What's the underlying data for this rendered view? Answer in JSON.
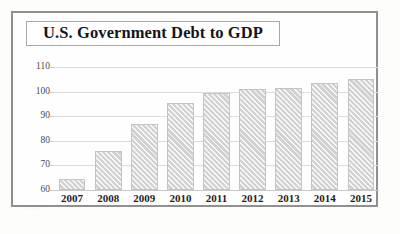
{
  "document": {
    "kind": "scanned-chart-figure"
  },
  "title": {
    "text": "U.S. Government Debt to GDP"
  },
  "axis": {
    "y_ticks": [
      "110",
      "100",
      "90",
      "80",
      "70",
      "60"
    ],
    "x_ticks": [
      "2007",
      "2008",
      "2009",
      "2010",
      "2011",
      "2012",
      "2013",
      "2014",
      "2015"
    ]
  },
  "colors": {
    "bar_fill": "#d2d2d2",
    "bar_border": "#c4c4c4",
    "gridline": "#dcdcdc",
    "frame": "#8f8f8f",
    "title_box_border": "#a8a8a8",
    "text": "#15151a",
    "page": "#fdfdfc"
  },
  "chart_data": {
    "type": "bar",
    "title": "U.S. Government Debt to GDP",
    "xlabel": "",
    "ylabel": "",
    "categories": [
      "2007",
      "2008",
      "2009",
      "2010",
      "2011",
      "2012",
      "2013",
      "2014",
      "2015"
    ],
    "values": [
      64.5,
      76,
      87,
      95.5,
      99.5,
      101,
      101.5,
      103.5,
      105
    ],
    "ylim": [
      60,
      110
    ],
    "ytick_step": 10,
    "yticks": [
      60,
      70,
      80,
      90,
      100,
      110
    ],
    "grid": true,
    "legend": "none",
    "series_name": "Debt to GDP (%)"
  }
}
